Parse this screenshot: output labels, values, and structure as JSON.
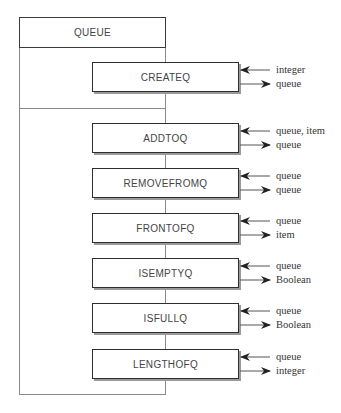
{
  "diagram": {
    "container": {
      "label": "QUEUE"
    },
    "operations": [
      {
        "name": "CREATEQ",
        "input": "integer",
        "output": "queue"
      },
      {
        "name": "ADDTOQ",
        "input": "queue, item",
        "output": "queue"
      },
      {
        "name": "REMOVEFROMQ",
        "input": "queue",
        "output": "queue"
      },
      {
        "name": "FRONTOFQ",
        "input": "queue",
        "output": "item"
      },
      {
        "name": "ISEMPTYQ",
        "input": "queue",
        "output": "Boolean"
      },
      {
        "name": "ISFULLQ",
        "input": "queue",
        "output": "Boolean"
      },
      {
        "name": "LENGTHOFQ",
        "input": "queue",
        "output": "integer"
      }
    ]
  }
}
